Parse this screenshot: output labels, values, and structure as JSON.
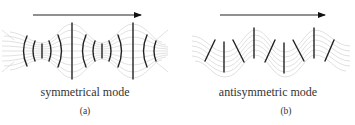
{
  "panels": [
    {
      "id": "a",
      "caption": "symmetrical mode",
      "sublabel": "(a)",
      "arrow": {
        "direction": "right"
      }
    },
    {
      "id": "b",
      "caption": "antisymmetric mode",
      "sublabel": "(b)",
      "arrow": {
        "direction": "right"
      }
    }
  ],
  "colors": {
    "ink": "#222222",
    "grid": "#d0d0d0",
    "text": "#333333"
  }
}
